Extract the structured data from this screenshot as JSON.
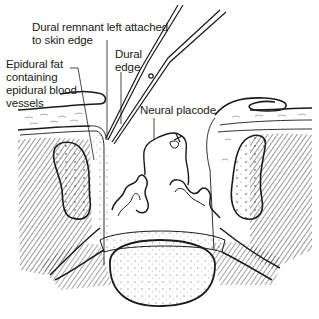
{
  "figure": {
    "type": "anatomical-illustration",
    "colors": {
      "ink": "#1a1a1a",
      "background": "#ffffff",
      "hatch": "#555555"
    }
  },
  "labels": [
    {
      "id": "dural-remnant",
      "text": "Dural remnant left attached\nto skin edge"
    },
    {
      "id": "dural-edge",
      "text": "Dural\nedge"
    },
    {
      "id": "epidural-fat",
      "text": "Epidural fat\ncontaining\nepidural blood\nvessels"
    },
    {
      "id": "neural-placode",
      "text": "Neural placode"
    }
  ],
  "instruments": [
    {
      "name": "scissors",
      "icon": "scissors-icon"
    }
  ]
}
